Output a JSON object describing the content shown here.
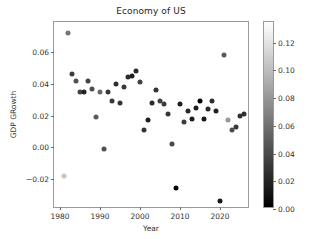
{
  "chart_data": {
    "type": "scatter",
    "title": "Economy of US",
    "xlabel": "Year",
    "ylabel": "GDP GRowth",
    "xlim": [
      1978.5,
      2027.5
    ],
    "ylim": [
      -0.039,
      0.079
    ],
    "grid": false,
    "legend": null,
    "xticks": [
      1980,
      1990,
      2000,
      2010,
      2020
    ],
    "xtick_labels": [
      "1980",
      "1990",
      "2000",
      "2010",
      "2020"
    ],
    "yticks": [
      0.06,
      0.04,
      0.02,
      0.0,
      -0.02
    ],
    "ytick_labels": [
      "0.06",
      "0.04",
      "0.02",
      "0.00",
      "−0.02"
    ],
    "colormap": "gray",
    "colorbar": {
      "vmin": 0.0,
      "vmax": 0.135,
      "ticks": [
        0.12,
        0.1,
        0.08,
        0.06,
        0.04,
        0.02,
        0.0
      ],
      "tick_labels": [
        "0.12",
        "0.10",
        "0.08",
        "0.06",
        "0.04",
        "0.02",
        "0.00"
      ],
      "low_color": "#000000",
      "high_color": "#ffffff",
      "position": "right"
    },
    "x": [
      1980,
      1981,
      1982,
      1983,
      1984,
      1985,
      1986,
      1987,
      1988,
      1989,
      1990,
      1991,
      1992,
      1993,
      1994,
      1995,
      1996,
      1997,
      1998,
      1999,
      2000,
      2001,
      2002,
      2003,
      2004,
      2005,
      2006,
      2007,
      2008,
      2009,
      2010,
      2011,
      2012,
      2013,
      2014,
      2015,
      2016,
      2017,
      2018,
      2019,
      2020,
      2021,
      2022,
      2023,
      2024,
      2025,
      2026
    ],
    "y": [
      0.025,
      -0.018,
      0.072,
      0.046,
      0.042,
      0.035,
      0.035,
      0.042,
      0.037,
      0.019,
      0.035,
      -0.001,
      0.035,
      0.029,
      0.04,
      0.028,
      0.038,
      0.044,
      0.045,
      0.048,
      0.041,
      0.011,
      0.017,
      0.028,
      0.036,
      0.029,
      0.027,
      0.021,
      0.002,
      -0.026,
      0.027,
      0.016,
      0.023,
      0.018,
      0.025,
      0.029,
      0.018,
      0.024,
      0.029,
      0.023,
      -0.034,
      0.058,
      0.017,
      0.011,
      0.013,
      0.02,
      0.021,
      0.02
    ],
    "color_values": [
      0.135,
      0.104,
      0.062,
      0.032,
      0.043,
      0.035,
      0.019,
      0.036,
      0.041,
      0.048,
      0.054,
      0.042,
      0.03,
      0.03,
      0.026,
      0.028,
      0.03,
      0.023,
      0.016,
      0.022,
      0.034,
      0.028,
      0.016,
      0.023,
      0.027,
      0.034,
      0.032,
      0.029,
      0.038,
      0.004,
      0.016,
      0.032,
      0.021,
      0.015,
      0.016,
      0.001,
      0.013,
      0.021,
      0.024,
      0.018,
      0.012,
      0.047,
      0.08,
      0.041,
      0.029,
      0.025,
      0.024
    ],
    "color_label": ""
  }
}
